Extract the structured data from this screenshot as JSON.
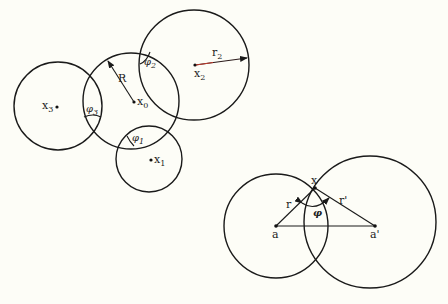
{
  "diagram": {
    "background": "#fdfdf7",
    "stroke_color": "#1a1a1a",
    "left_figure": {
      "circles": [
        {
          "id": "x0",
          "cx": 131,
          "cy": 101,
          "r": 48,
          "center_label": "x",
          "center_sub": "0"
        },
        {
          "id": "x1",
          "cx": 149,
          "cy": 159,
          "r": 33,
          "center_label": "x",
          "center_sub": "1"
        },
        {
          "id": "x2",
          "cx": 194,
          "cy": 65,
          "r": 55,
          "center_label": "x",
          "center_sub": "2"
        },
        {
          "id": "x3",
          "cx": 58,
          "cy": 106,
          "r": 44,
          "center_label": "x",
          "center_sub": "3"
        }
      ],
      "radius_labels": {
        "R": "R",
        "r2": "r",
        "r2_sub": "2"
      },
      "angle_labels": [
        {
          "symbol": "φ",
          "sub": "1"
        },
        {
          "symbol": "φ",
          "sub": "2"
        },
        {
          "symbol": "φ",
          "sub": "3"
        }
      ]
    },
    "right_figure": {
      "circles": [
        {
          "id": "a",
          "cx": 276,
          "cy": 226,
          "r": 52,
          "center_label": "a"
        },
        {
          "id": "a_prime",
          "cx": 370,
          "cy": 222,
          "r": 66,
          "center_label": "a'"
        }
      ],
      "point_label": "x",
      "radius_labels": {
        "r": "r",
        "r_prime": "r'"
      },
      "angle_label": "φ"
    }
  }
}
